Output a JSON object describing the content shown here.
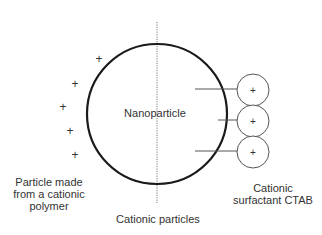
{
  "diagram": {
    "nanoparticle_label": "Nanoparticle",
    "left_label": [
      "Particle made",
      "from a cationic",
      "polymer"
    ],
    "bottom_label": "Cationic particles",
    "right_label": [
      "Cationic",
      "surfactant CTAB"
    ],
    "charge_symbol": "+",
    "colors": {
      "stroke": "#1a1a1a",
      "thin_stroke": "#555555",
      "text": "#333333",
      "background": "#ffffff"
    }
  }
}
